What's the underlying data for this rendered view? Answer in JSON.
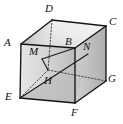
{
  "figure": {
    "type": "geometry-diagram",
    "shape": "cube",
    "canvas": {
      "width": 123,
      "height": 124
    },
    "colors": {
      "background": "#ffffff",
      "stroke": "#1a1a1a",
      "hidden_stroke": "#4d4d4d",
      "label": "#111111",
      "face_front_light": "#e8e8e8",
      "face_front_dark": "#b8b8b8",
      "face_left_light": "#d8d8d8",
      "face_left_dark": "#a8a8a8",
      "face_top_light": "#f0f0f0",
      "face_top_dark": "#cccccc",
      "face_right_light": "#dcdcdc",
      "face_right_dark": "#b0b0b0",
      "triangle_fill": "#bfbfbf"
    },
    "vertices": [
      {
        "id": "A",
        "label": "A",
        "x": 21,
        "y": 44,
        "label_x": 4,
        "label_y": 37,
        "hidden": false
      },
      {
        "id": "B",
        "label": "B",
        "x": 75,
        "y": 48,
        "label_x": 65,
        "label_y": 36,
        "hidden": false
      },
      {
        "id": "C",
        "label": "C",
        "x": 106,
        "y": 26,
        "label_x": 109,
        "label_y": 16,
        "hidden": false
      },
      {
        "id": "D",
        "label": "D",
        "x": 52,
        "y": 20,
        "label_x": 45,
        "label_y": 3,
        "hidden": false
      },
      {
        "id": "E",
        "label": "E",
        "x": 20,
        "y": 98,
        "label_x": 5,
        "label_y": 91,
        "hidden": false
      },
      {
        "id": "F",
        "label": "F",
        "x": 75,
        "y": 103,
        "label_x": 71,
        "label_y": 107,
        "hidden": false
      },
      {
        "id": "G",
        "label": "G",
        "x": 106,
        "y": 81,
        "label_x": 108,
        "label_y": 73,
        "hidden": false
      },
      {
        "id": "H",
        "label": "H",
        "x": 48,
        "y": 70,
        "label_x": 44,
        "label_y": 75,
        "hidden": true
      },
      {
        "id": "M",
        "label": "M",
        "x": 42,
        "y": 59,
        "label_x": 29,
        "label_y": 46,
        "hidden": false
      },
      {
        "id": "N",
        "label": "N",
        "x": 88,
        "y": 54,
        "label_x": 83,
        "label_y": 41,
        "hidden": false
      }
    ],
    "edges": [
      {
        "from": "A",
        "to": "B",
        "style": "solid"
      },
      {
        "from": "A",
        "to": "D",
        "style": "solid"
      },
      {
        "from": "A",
        "to": "E",
        "style": "solid"
      },
      {
        "from": "D",
        "to": "C",
        "style": "solid"
      },
      {
        "from": "B",
        "to": "C",
        "style": "solid"
      },
      {
        "from": "B",
        "to": "F",
        "style": "solid"
      },
      {
        "from": "C",
        "to": "G",
        "style": "solid"
      },
      {
        "from": "E",
        "to": "F",
        "style": "solid"
      },
      {
        "from": "F",
        "to": "G",
        "style": "solid"
      },
      {
        "from": "D",
        "to": "H",
        "style": "dotted"
      },
      {
        "from": "H",
        "to": "E",
        "style": "dotted"
      },
      {
        "from": "H",
        "to": "G",
        "style": "dotted"
      }
    ],
    "construction_lines": [
      {
        "from": "E",
        "to": "N",
        "style": "solid",
        "name": "diagonal-E-N"
      },
      {
        "from": "M",
        "to": "H",
        "style": "solid",
        "name": "segment-M-H"
      },
      {
        "from": "M",
        "to": "B",
        "style": "solid",
        "name": "segment-M-B"
      }
    ],
    "labels_order": [
      "D",
      "C",
      "A",
      "M",
      "B",
      "N",
      "H",
      "E",
      "G",
      "F"
    ]
  }
}
